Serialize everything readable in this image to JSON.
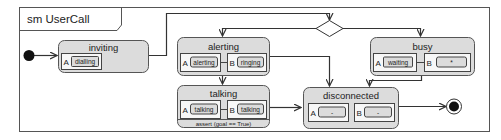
{
  "diagram": {
    "title": "sm UserCall",
    "states": {
      "inviting": {
        "name": "inviting",
        "regions": [
          {
            "label": "A",
            "substate": "dialling"
          }
        ]
      },
      "alerting": {
        "name": "alerting",
        "regions": [
          {
            "label": "A",
            "substate": "alerting"
          },
          {
            "label": "B",
            "substate": "ringing"
          }
        ]
      },
      "talking": {
        "name": "talking",
        "regions": [
          {
            "label": "A",
            "substate": "talking"
          },
          {
            "label": "B",
            "substate": "talking"
          }
        ],
        "invariant": "assert (goal == True)"
      },
      "busy": {
        "name": "busy",
        "regions": [
          {
            "label": "A",
            "substate": "waiting"
          },
          {
            "label": "B",
            "substate": "*"
          }
        ]
      },
      "disconnected": {
        "name": "disconnected",
        "regions": [
          {
            "label": "A",
            "substate": "-"
          },
          {
            "label": "B",
            "substate": "-"
          }
        ]
      }
    },
    "pseudostates": {
      "initial": "initial",
      "choice": "choice",
      "final": "final"
    },
    "colors": {
      "state_fill": "#dcdcdc",
      "region_fill": "#f7f7f7",
      "stroke": "#444444"
    }
  }
}
